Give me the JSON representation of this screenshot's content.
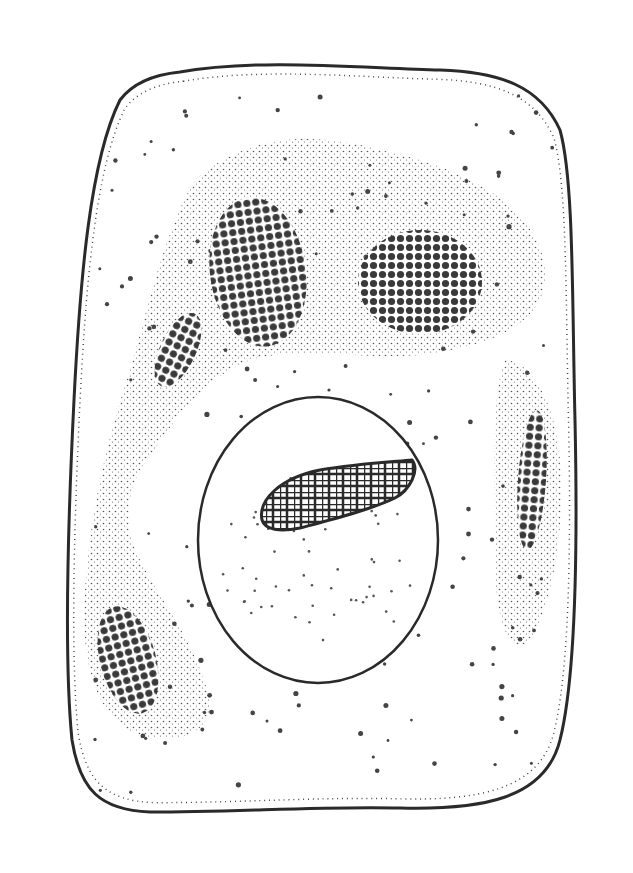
{
  "image": {
    "width": 633,
    "height": 873,
    "background": "#ffffff",
    "subject": "stipple illustration of a cell",
    "colors": {
      "ink": "#2a2a2a",
      "dark_mass": "#3a3a3a",
      "stipple": "#555555",
      "paper": "#ffffff"
    }
  },
  "cell": {
    "outline_path": "M180,72 C260,58 360,68 440,70 C500,72 540,86 560,130 C574,180 572,300 575,420 C578,560 575,680 560,740 C545,800 480,810 400,808 C320,806 240,812 150,812 C100,810 80,790 72,740 C64,660 68,520 74,400 C80,280 90,160 120,100 C135,80 160,74 180,72 Z"
  },
  "cytoplasm_region": {
    "path": "M195,180 C240,140 300,128 380,150 C470,168 540,210 545,270 C548,320 500,345 420,355 C360,360 300,345 250,360 C200,380 175,420 140,470 C120,510 130,540 140,560 C160,600 195,640 210,700 C212,735 175,745 140,735 C95,720 80,660 85,590 C90,510 110,430 130,370 C150,300 165,230 195,180 Z",
    "right_lobe_path": "M505,360 C530,360 555,400 560,460 C565,520 555,600 530,640 C510,660 495,620 495,560 C495,480 490,400 505,360 Z"
  },
  "dark_masses": [
    {
      "name": "upper-left-mass",
      "cx": 258,
      "cy": 272,
      "rx": 48,
      "ry": 75,
      "rotate": -8
    },
    {
      "name": "upper-right-mass",
      "cx": 420,
      "cy": 282,
      "rx": 62,
      "ry": 52,
      "rotate": 0
    },
    {
      "name": "left-rod-mass",
      "cx": 178,
      "cy": 350,
      "rx": 18,
      "ry": 40,
      "rotate": 25
    },
    {
      "name": "lower-left-mass",
      "cx": 128,
      "cy": 660,
      "rx": 28,
      "ry": 55,
      "rotate": -15
    },
    {
      "name": "right-rod-mass",
      "cx": 532,
      "cy": 480,
      "rx": 14,
      "ry": 70,
      "rotate": 4
    }
  ],
  "nucleus": {
    "cx": 318,
    "cy": 540,
    "rx": 120,
    "ry": 143
  },
  "nucleolus": {
    "path": "M262,520 C258,500 280,478 320,470 C355,464 390,462 412,460 C420,470 410,490 395,498 C370,510 330,520 300,528 C280,532 265,530 262,520 Z"
  }
}
